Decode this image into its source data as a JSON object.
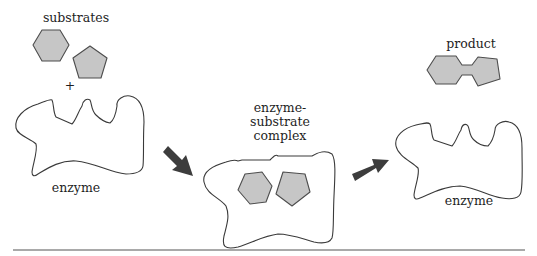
{
  "diagram": {
    "type": "enzyme-substrate reaction process",
    "colors": {
      "molecule_fill": "#c6c6c6",
      "molecule_stroke": "#4d4d4d",
      "outline": "#3a3a3a",
      "arrow": "#3d3d3d",
      "background": "#ffffff"
    },
    "stage1": {
      "substrates_label": "substrates",
      "plus_sign": "+",
      "enzyme_label": "enzyme",
      "molecules": [
        "hexagon-substrate",
        "pentagon-substrate"
      ]
    },
    "stage2": {
      "label_line1": "enzyme-",
      "label_line2": "substrate",
      "label_line3": "complex",
      "molecules": [
        "hexagon-substrate-bound",
        "pentagon-substrate-bound"
      ]
    },
    "stage3": {
      "product_label": "product",
      "enzyme_label": "enzyme",
      "molecules": [
        "hexagon-pentagon-product"
      ]
    },
    "arrows": [
      {
        "from": "stage1",
        "to": "stage2",
        "direction": "down-right"
      },
      {
        "from": "stage2",
        "to": "stage3",
        "direction": "up-right"
      }
    ]
  }
}
